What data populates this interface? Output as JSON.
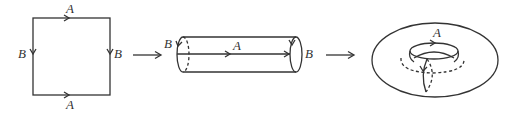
{
  "diagram": {
    "type": "torus-construction",
    "panels": [
      {
        "name": "square",
        "labels": {
          "top": "A",
          "bottom": "A",
          "left": "B",
          "right": "B"
        }
      },
      {
        "name": "cylinder",
        "labels": {
          "left_end": "B",
          "middle": "A",
          "right_end": "B"
        }
      },
      {
        "name": "torus",
        "labels": {
          "top": "A"
        }
      }
    ],
    "transition_arrows": 2,
    "colors": {
      "stroke": "#333333",
      "background": "#ffffff"
    }
  },
  "labels": {
    "square_top": "A",
    "square_bottom": "A",
    "square_left": "B",
    "square_right": "B",
    "cyl_left": "B",
    "cyl_mid": "A",
    "cyl_right": "B",
    "torus_top": "A"
  }
}
